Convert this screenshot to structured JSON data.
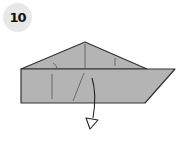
{
  "step": {
    "number": "10"
  },
  "colors": {
    "paper": "#b4b4b4",
    "outline": "#333333",
    "badge_bg": "#e8e8e8",
    "crease": "#555555"
  },
  "diagram": {
    "arrow": "mountain-fold-arrow"
  }
}
